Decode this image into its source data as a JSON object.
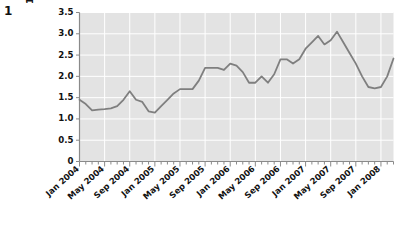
{
  "figure": {
    "number": "1"
  },
  "chart_data": {
    "type": "line",
    "title": "",
    "xlabel": "",
    "ylabel": "% change on\n12 months earlier",
    "ylim": [
      0,
      3.5
    ],
    "y_ticks": [
      "0",
      "0.5",
      "1.0",
      "1.5",
      "2.0",
      "2.5",
      "3.0",
      "3.5"
    ],
    "y_tick_values": [
      0,
      0.5,
      1.0,
      1.5,
      2.0,
      2.5,
      3.0,
      3.5
    ],
    "grid": true,
    "legend": "none",
    "x_tick_labels": [
      "Jan 2004",
      "May 2004",
      "Sep 2004",
      "Jan 2005",
      "May 2005",
      "Sep 2005",
      "Jan 2006",
      "May 2006",
      "Sep 2006",
      "Jan 2007",
      "May 2007",
      "Sep 2007",
      "Jan 2008"
    ],
    "x_tick_indices": [
      0,
      4,
      8,
      12,
      16,
      20,
      24,
      28,
      32,
      36,
      40,
      44,
      48
    ],
    "x": [
      "Jan 2004",
      "Feb 2004",
      "Mar 2004",
      "Apr 2004",
      "May 2004",
      "Jun 2004",
      "Jul 2004",
      "Aug 2004",
      "Sep 2004",
      "Oct 2004",
      "Nov 2004",
      "Dec 2004",
      "Jan 2005",
      "Feb 2005",
      "Mar 2005",
      "Apr 2005",
      "May 2005",
      "Jun 2005",
      "Jul 2005",
      "Aug 2005",
      "Sep 2005",
      "Oct 2005",
      "Nov 2005",
      "Dec 2005",
      "Jan 2006",
      "Feb 2006",
      "Mar 2006",
      "Apr 2006",
      "May 2006",
      "Jun 2006",
      "Jul 2006",
      "Aug 2006",
      "Sep 2006",
      "Oct 2006",
      "Nov 2006",
      "Dec 2006",
      "Jan 2007",
      "Feb 2007",
      "Mar 2007",
      "Apr 2007",
      "May 2007",
      "Jun 2007",
      "Jul 2007",
      "Aug 2007",
      "Sep 2007",
      "Oct 2007",
      "Nov 2007",
      "Dec 2007",
      "Jan 2008",
      "Feb 2008",
      "Mar 2008"
    ],
    "values": [
      1.45,
      1.35,
      1.2,
      1.22,
      1.23,
      1.25,
      1.3,
      1.45,
      1.65,
      1.45,
      1.4,
      1.18,
      1.15,
      1.3,
      1.45,
      1.6,
      1.7,
      1.7,
      1.7,
      1.9,
      2.2,
      2.2,
      2.2,
      2.15,
      2.3,
      2.25,
      2.1,
      1.85,
      1.85,
      2.0,
      1.85,
      2.05,
      2.4,
      2.4,
      2.3,
      2.4,
      2.65,
      2.8,
      2.95,
      2.75,
      2.85,
      3.05,
      2.8,
      2.55,
      2.3,
      2.0,
      1.75,
      1.72,
      1.75,
      2.0,
      2.42
    ]
  }
}
